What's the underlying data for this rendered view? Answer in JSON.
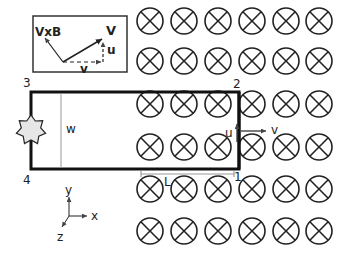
{
  "diagram": {
    "field": {
      "symbol": "into-page",
      "rows_y": [
        21,
        61,
        104,
        147,
        189,
        231
      ],
      "cols_x": [
        150,
        184,
        218,
        252,
        286,
        319
      ],
      "radius": 13
    },
    "inset": {
      "labels": {
        "vxb": "VxB",
        "V": "V",
        "u": "u",
        "v": "v"
      }
    },
    "loop": {
      "corners": {
        "c1": "1",
        "c2": "2",
        "c3": "3",
        "c4": "4"
      },
      "width_label": "w",
      "length_label": "L",
      "velocity_u": "u",
      "velocity_v": "v"
    },
    "axes": {
      "x": "x",
      "y": "y",
      "z": "z"
    }
  }
}
